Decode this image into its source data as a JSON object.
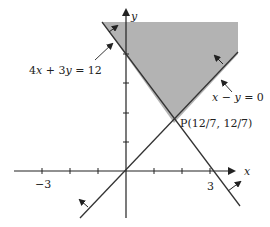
{
  "diagram": {
    "type": "linear-inequality-feasible-region",
    "axes": {
      "x_label": "x",
      "y_label": "y",
      "x_ticks": [
        -3,
        -2,
        -1,
        1,
        2,
        3
      ],
      "x_tick_labels": {
        "neg3": "−3",
        "pos3": "3"
      },
      "y_ticks": [
        1,
        2,
        3,
        4
      ]
    },
    "lines": [
      {
        "id": "line1",
        "equation": "4x + 3y = 12",
        "label_parts": {
          "a": "4",
          "x": "x",
          "plus": " + ",
          "b": "3",
          "y": "y",
          "eq": " = 12"
        }
      },
      {
        "id": "line2",
        "equation": "x − y = 0",
        "label_parts": {
          "x": "x",
          "minus": " − ",
          "y": "y",
          "eq": " = 0"
        }
      }
    ],
    "point": {
      "label": "P(12/7, 12/7)",
      "x": "12/7",
      "y": "12/7"
    },
    "shaded_region": {
      "description": "4x + 3y ≥ 12 and x − y ≤ 0",
      "color": "#b3b3b3"
    },
    "colors": {
      "line": "#333333",
      "axis": "#222222",
      "shade": "#b3b3b3"
    }
  }
}
